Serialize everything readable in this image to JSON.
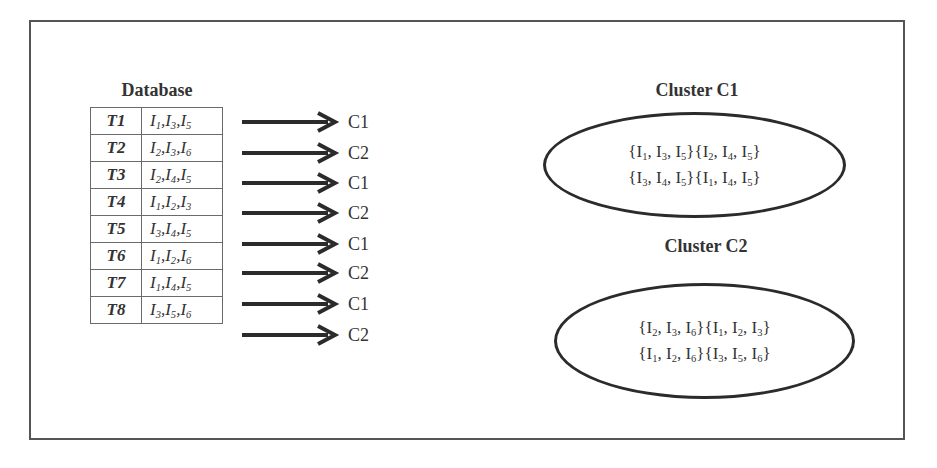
{
  "database": {
    "title": "Database",
    "rows": [
      {
        "tid": "T1",
        "items": [
          [
            "I",
            "1"
          ],
          [
            "I",
            "3"
          ],
          [
            "I",
            "5"
          ]
        ],
        "cluster": "C1"
      },
      {
        "tid": "T2",
        "items": [
          [
            "I",
            "2"
          ],
          [
            "I",
            "3"
          ],
          [
            "I",
            "6"
          ]
        ],
        "cluster": "C2"
      },
      {
        "tid": "T3",
        "items": [
          [
            "I",
            "2"
          ],
          [
            "I",
            "4"
          ],
          [
            "I",
            "5"
          ]
        ],
        "cluster": "C1"
      },
      {
        "tid": "T4",
        "items": [
          [
            "I",
            "1"
          ],
          [
            "I",
            "2"
          ],
          [
            "I",
            "3"
          ]
        ],
        "cluster": "C2"
      },
      {
        "tid": "T5",
        "items": [
          [
            "I",
            "3"
          ],
          [
            "I",
            "4"
          ],
          [
            "I",
            "5"
          ]
        ],
        "cluster": "C1"
      },
      {
        "tid": "T6",
        "items": [
          [
            "I",
            "1"
          ],
          [
            "I",
            "2"
          ],
          [
            "I",
            "6"
          ]
        ],
        "cluster": "C2"
      },
      {
        "tid": "T7",
        "items": [
          [
            "I",
            "1"
          ],
          [
            "I",
            "4"
          ],
          [
            "I",
            "5"
          ]
        ],
        "cluster": "C1"
      },
      {
        "tid": "T8",
        "items": [
          [
            "I",
            "3"
          ],
          [
            "I",
            "5"
          ],
          [
            "I",
            "6"
          ]
        ],
        "cluster": "C2"
      }
    ]
  },
  "arrows": {
    "labels": [
      "C1",
      "C2",
      "C1",
      "C2",
      "C1",
      "C2",
      "C1",
      "C2"
    ]
  },
  "clusters": [
    {
      "title": "Cluster C1",
      "sets": [
        [
          [
            "I",
            "1"
          ],
          [
            "I",
            "3"
          ],
          [
            "I",
            "5"
          ]
        ],
        [
          [
            "I",
            "2"
          ],
          [
            "I",
            "4"
          ],
          [
            "I",
            "5"
          ]
        ],
        [
          [
            "I",
            "3"
          ],
          [
            "I",
            "4"
          ],
          [
            "I",
            "5"
          ]
        ],
        [
          [
            "I",
            "1"
          ],
          [
            "I",
            "4"
          ],
          [
            "I",
            "5"
          ]
        ]
      ]
    },
    {
      "title": "Cluster C2",
      "sets": [
        [
          [
            "I",
            "2"
          ],
          [
            "I",
            "3"
          ],
          [
            "I",
            "6"
          ]
        ],
        [
          [
            "I",
            "1"
          ],
          [
            "I",
            "2"
          ],
          [
            "I",
            "3"
          ]
        ],
        [
          [
            "I",
            "1"
          ],
          [
            "I",
            "2"
          ],
          [
            "I",
            "6"
          ]
        ],
        [
          [
            "I",
            "3"
          ],
          [
            "I",
            "5"
          ],
          [
            "I",
            "6"
          ]
        ]
      ]
    }
  ],
  "colors": {
    "frame": "#555555",
    "ink": "#333333",
    "arrow": "#2b2b2b"
  }
}
